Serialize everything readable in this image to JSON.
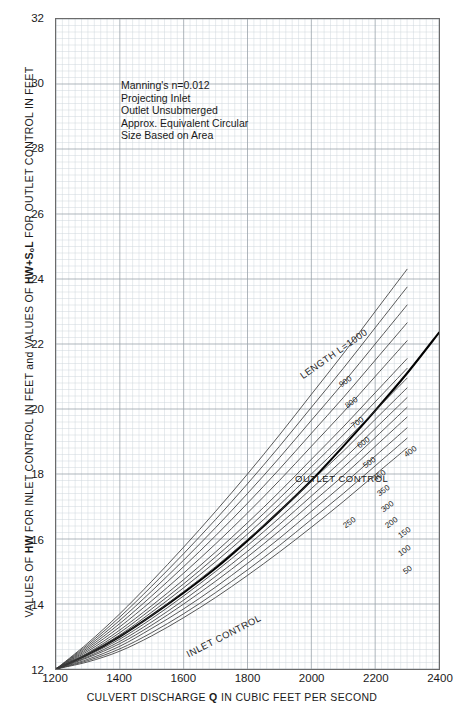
{
  "chart_data": {
    "type": "line",
    "title": "",
    "xlabel": "CULVERT DISCHARGE Q IN CUBIC FEET PER SECOND",
    "ylabel": "VALUES OF HW FOR INLET CONTROL IN FEET and VALUES OF HW+SₒL FOR OUTLET CONTROL IN FEET",
    "xlim": [
      1200,
      2400
    ],
    "ylim": [
      12,
      32
    ],
    "xticks": [
      1200,
      1400,
      1600,
      1800,
      2000,
      2200,
      2400
    ],
    "yticks": [
      12,
      14,
      16,
      18,
      20,
      22,
      24,
      26,
      28,
      30,
      32
    ],
    "grid": "major-and-minor",
    "legend": "inline-curve-labels",
    "notes": [
      "Manning's n=0.012",
      "Projecting Inlet",
      "Outlet Unsubmerged",
      "Approx. Equivalent Circular",
      "Size Based on Area"
    ],
    "annotations": [
      {
        "text": "LENGTH L=1000",
        "x": 2030,
        "y": 21.9,
        "rotation": -35
      },
      {
        "text": "OUTLET CONTROL",
        "x": 1985,
        "y": 18.55,
        "rotation": 0
      },
      {
        "text": "INLET CONTROL",
        "x": 1730,
        "y": 12.75,
        "rotation": -27
      }
    ],
    "series": [
      {
        "name": "INLET CONTROL",
        "emphasis": "bold",
        "points": [
          [
            1200,
            12.0
          ],
          [
            1300,
            12.45
          ],
          [
            1400,
            13.0
          ],
          [
            1500,
            13.65
          ],
          [
            1600,
            14.35
          ],
          [
            1700,
            15.1
          ],
          [
            1800,
            15.95
          ],
          [
            1900,
            16.85
          ],
          [
            2000,
            17.8
          ],
          [
            2100,
            18.85
          ],
          [
            2200,
            19.95
          ],
          [
            2300,
            21.1
          ],
          [
            2400,
            22.35
          ]
        ]
      },
      {
        "name": "L=1000",
        "label": "LENGTH L=1000",
        "points": [
          [
            1200,
            12.0
          ],
          [
            1300,
            12.8
          ],
          [
            1400,
            13.7
          ],
          [
            1500,
            14.7
          ],
          [
            1600,
            15.75
          ],
          [
            1700,
            16.85
          ],
          [
            1800,
            18.0
          ],
          [
            1900,
            19.2
          ],
          [
            2000,
            20.45
          ],
          [
            2100,
            21.7
          ],
          [
            2200,
            23.0
          ],
          [
            2300,
            24.3
          ],
          [
            2400,
            23.7
          ]
        ]
      },
      {
        "name": "L=900",
        "label": "900",
        "points": [
          [
            1200,
            12.0
          ],
          [
            1300,
            12.75
          ],
          [
            1400,
            13.6
          ],
          [
            1500,
            14.55
          ],
          [
            1600,
            15.55
          ],
          [
            1700,
            16.6
          ],
          [
            1800,
            17.7
          ],
          [
            1900,
            18.85
          ],
          [
            2000,
            20.05
          ],
          [
            2100,
            21.25
          ],
          [
            2200,
            22.5
          ],
          [
            2300,
            23.75
          ],
          [
            2400,
            23.0
          ]
        ]
      },
      {
        "name": "L=800",
        "label": "800",
        "points": [
          [
            1200,
            12.0
          ],
          [
            1300,
            12.7
          ],
          [
            1400,
            13.5
          ],
          [
            1500,
            14.4
          ],
          [
            1600,
            15.35
          ],
          [
            1700,
            16.35
          ],
          [
            1800,
            17.4
          ],
          [
            1900,
            18.5
          ],
          [
            2000,
            19.65
          ],
          [
            2100,
            20.8
          ],
          [
            2200,
            22.0
          ],
          [
            2300,
            23.2
          ],
          [
            2400,
            22.5
          ]
        ]
      },
      {
        "name": "L=700",
        "label": "700",
        "points": [
          [
            1200,
            12.0
          ],
          [
            1300,
            12.65
          ],
          [
            1400,
            13.4
          ],
          [
            1500,
            14.25
          ],
          [
            1600,
            15.15
          ],
          [
            1700,
            16.1
          ],
          [
            1800,
            17.1
          ],
          [
            1900,
            18.15
          ],
          [
            2000,
            19.25
          ],
          [
            2100,
            20.35
          ],
          [
            2200,
            21.5
          ],
          [
            2300,
            22.65
          ],
          [
            2400,
            22.0
          ]
        ]
      },
      {
        "name": "L=600",
        "label": "600",
        "points": [
          [
            1200,
            12.0
          ],
          [
            1300,
            12.6
          ],
          [
            1400,
            13.3
          ],
          [
            1500,
            14.1
          ],
          [
            1600,
            14.95
          ],
          [
            1700,
            15.85
          ],
          [
            1800,
            16.8
          ],
          [
            1900,
            17.8
          ],
          [
            2000,
            18.85
          ],
          [
            2100,
            19.9
          ],
          [
            2200,
            21.0
          ],
          [
            2300,
            22.1
          ],
          [
            2400,
            21.5
          ]
        ]
      },
      {
        "name": "L=500",
        "label": "500",
        "points": [
          [
            1200,
            12.0
          ],
          [
            1300,
            12.55
          ],
          [
            1400,
            13.2
          ],
          [
            1500,
            13.95
          ],
          [
            1600,
            14.75
          ],
          [
            1700,
            15.6
          ],
          [
            1800,
            16.5
          ],
          [
            1900,
            17.45
          ],
          [
            2000,
            18.45
          ],
          [
            2100,
            19.45
          ],
          [
            2200,
            20.5
          ],
          [
            2300,
            21.55
          ],
          [
            2400,
            21.0
          ]
        ]
      },
      {
        "name": "L=450",
        "label": "450",
        "points": [
          [
            1200,
            12.0
          ],
          [
            1300,
            12.5
          ],
          [
            1400,
            13.12
          ],
          [
            1500,
            13.85
          ],
          [
            1600,
            14.62
          ],
          [
            1700,
            15.45
          ],
          [
            1800,
            16.32
          ],
          [
            1900,
            17.25
          ],
          [
            2000,
            18.22
          ],
          [
            2100,
            19.2
          ],
          [
            2200,
            20.22
          ],
          [
            2300,
            21.25
          ],
          [
            2400,
            20.7
          ]
        ]
      },
      {
        "name": "L=400",
        "label": "400",
        "points": [
          [
            1200,
            12.0
          ],
          [
            1300,
            12.48
          ],
          [
            1400,
            13.05
          ],
          [
            1500,
            13.75
          ],
          [
            1600,
            14.5
          ],
          [
            1700,
            15.3
          ],
          [
            1800,
            16.15
          ],
          [
            1900,
            17.05
          ],
          [
            2000,
            18.0
          ],
          [
            2100,
            18.95
          ],
          [
            2200,
            19.95
          ],
          [
            2300,
            20.95
          ],
          [
            2400,
            20.4
          ]
        ]
      },
      {
        "name": "L=350",
        "label": "350",
        "points": [
          [
            1200,
            12.0
          ],
          [
            1300,
            12.45
          ],
          [
            1400,
            13.0
          ],
          [
            1500,
            13.65
          ],
          [
            1600,
            14.38
          ],
          [
            1700,
            15.15
          ],
          [
            1800,
            15.98
          ],
          [
            1900,
            16.85
          ],
          [
            2000,
            17.78
          ],
          [
            2100,
            18.7
          ],
          [
            2200,
            19.68
          ],
          [
            2300,
            20.65
          ],
          [
            2400,
            20.1
          ]
        ]
      },
      {
        "name": "L=300",
        "label": "300",
        "points": [
          [
            1200,
            12.0
          ],
          [
            1300,
            12.42
          ],
          [
            1400,
            12.92
          ],
          [
            1500,
            13.55
          ],
          [
            1600,
            14.25
          ],
          [
            1700,
            15.0
          ],
          [
            1800,
            15.8
          ],
          [
            1900,
            16.65
          ],
          [
            2000,
            17.55
          ],
          [
            2100,
            18.45
          ],
          [
            2200,
            19.4
          ],
          [
            2300,
            20.35
          ],
          [
            2400,
            19.8
          ]
        ]
      },
      {
        "name": "L=250",
        "label": "250",
        "points": [
          [
            1200,
            12.0
          ],
          [
            1300,
            12.38
          ],
          [
            1400,
            12.85
          ],
          [
            1500,
            13.45
          ],
          [
            1600,
            14.12
          ],
          [
            1700,
            14.85
          ],
          [
            1800,
            15.62
          ],
          [
            1900,
            16.45
          ],
          [
            2000,
            17.32
          ],
          [
            2100,
            18.2
          ],
          [
            2200,
            19.12
          ],
          [
            2300,
            20.05
          ],
          [
            2400,
            19.5
          ]
        ]
      },
      {
        "name": "L=200",
        "label": "200",
        "points": [
          [
            1200,
            12.0
          ],
          [
            1300,
            12.35
          ],
          [
            1400,
            12.78
          ],
          [
            1500,
            13.35
          ],
          [
            1600,
            14.0
          ],
          [
            1700,
            14.7
          ],
          [
            1800,
            15.45
          ],
          [
            1900,
            16.25
          ],
          [
            2000,
            17.1
          ],
          [
            2100,
            17.95
          ],
          [
            2200,
            18.85
          ],
          [
            2300,
            19.75
          ],
          [
            2400,
            19.2
          ]
        ]
      },
      {
        "name": "L=150",
        "label": "150",
        "points": [
          [
            1200,
            12.0
          ],
          [
            1300,
            12.3
          ],
          [
            1400,
            12.7
          ],
          [
            1500,
            13.25
          ],
          [
            1600,
            13.85
          ],
          [
            1700,
            14.52
          ],
          [
            1800,
            15.25
          ],
          [
            1900,
            16.02
          ],
          [
            2000,
            16.85
          ],
          [
            2100,
            17.68
          ],
          [
            2200,
            18.55
          ],
          [
            2300,
            19.42
          ],
          [
            2400,
            18.9
          ]
        ]
      },
      {
        "name": "L=100",
        "label": "100",
        "points": [
          [
            1200,
            12.0
          ],
          [
            1300,
            12.26
          ],
          [
            1400,
            12.62
          ],
          [
            1500,
            13.12
          ],
          [
            1600,
            13.7
          ],
          [
            1700,
            14.35
          ],
          [
            1800,
            15.05
          ],
          [
            1900,
            15.8
          ],
          [
            2000,
            16.6
          ],
          [
            2100,
            17.4
          ],
          [
            2200,
            18.25
          ],
          [
            2300,
            19.1
          ],
          [
            2400,
            18.55
          ]
        ]
      },
      {
        "name": "L=50",
        "label": "50",
        "points": [
          [
            1200,
            12.0
          ],
          [
            1300,
            12.22
          ],
          [
            1400,
            12.55
          ],
          [
            1500,
            13.02
          ],
          [
            1600,
            13.58
          ],
          [
            1700,
            14.2
          ],
          [
            1800,
            14.88
          ],
          [
            1900,
            15.6
          ],
          [
            2000,
            16.36
          ],
          [
            2100,
            17.15
          ],
          [
            2200,
            17.98
          ],
          [
            2300,
            18.8
          ],
          [
            2400,
            18.25
          ]
        ]
      }
    ]
  },
  "axis": {
    "y_title_plain_1": "VALUES OF ",
    "y_title_bold_1": "HW",
    "y_title_plain_2": " FOR INLET CONTROL IN FEET and VALUES OF ",
    "y_title_bold_2": "HW+SₒL",
    "y_title_plain_3": " FOR OUTLET CONTROL IN FEET",
    "x_title_plain_1": "CULVERT DISCHARGE ",
    "x_title_bold_1": "Q",
    "x_title_plain_2": " IN CUBIC FEET PER SECOND",
    "yticks": [
      "32",
      "30",
      "28",
      "26",
      "24",
      "22",
      "20",
      "18",
      "16",
      "14",
      "12"
    ],
    "xticks": [
      "1200",
      "1400",
      "1600",
      "1800",
      "2000",
      "2200",
      "2400"
    ]
  },
  "notes": {
    "line1": "Manning's n=0.012",
    "line2": "Projecting Inlet",
    "line3": "Outlet Unsubmerged",
    "line4": "Approx. Equivalent Circular",
    "line5": "Size Based on Area"
  },
  "plot_labels": {
    "length_label": "LENGTH L=1000",
    "outlet_control": "OUTLET CONTROL",
    "inlet_control": "INLET CONTROL",
    "curve_900": "900",
    "curve_800": "800",
    "curve_700": "700",
    "curve_600": "600",
    "curve_500": "500",
    "curve_450": "450",
    "curve_400": "400",
    "curve_350": "350",
    "curve_300": "300",
    "curve_250": "250",
    "curve_200": "200",
    "curve_150": "150",
    "curve_100": "100",
    "curve_50": "50"
  },
  "colors": {
    "grid_minor": "#cfd6dd",
    "grid_major": "#9aa3ab",
    "frame": "#6b6b6b",
    "curve": "#3a3a3a",
    "curve_bold": "#000000",
    "text": "#1a1a1a",
    "background": "#ffffff"
  }
}
